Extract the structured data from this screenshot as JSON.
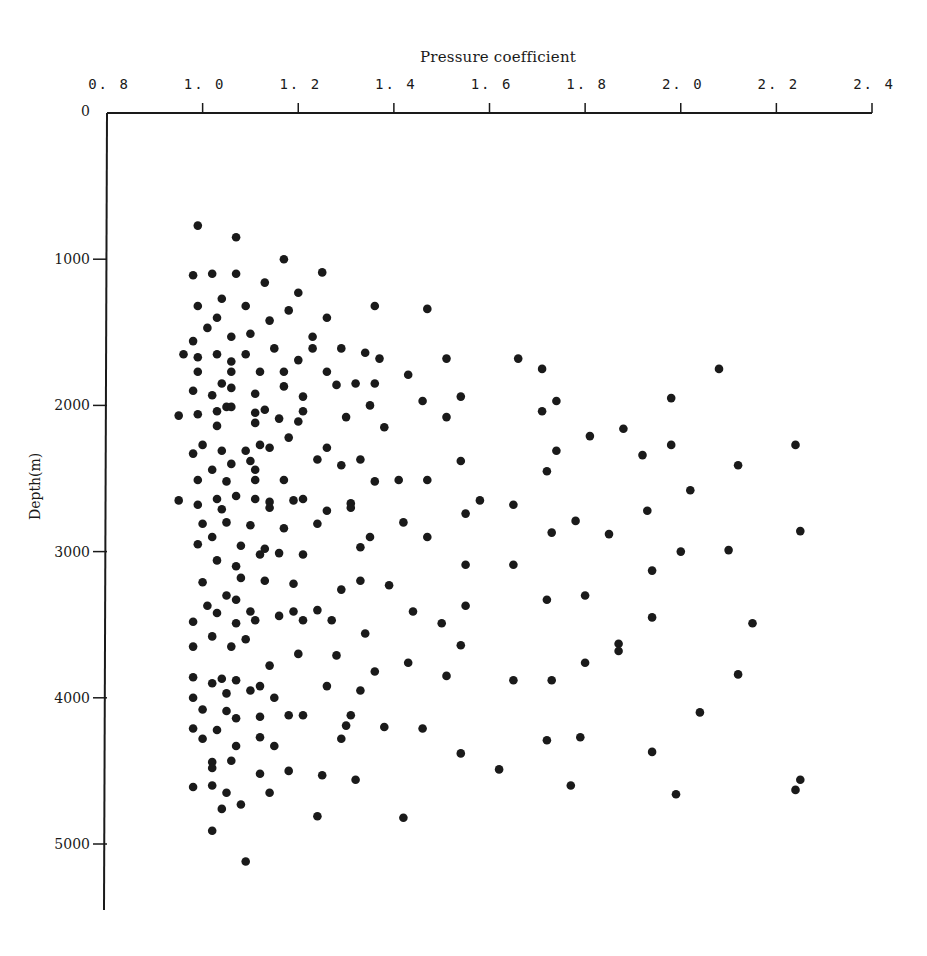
{
  "chart_data": {
    "type": "scatter",
    "title": "Pressure coefficient",
    "xlabel": "Pressure coefficient",
    "ylabel": "Depth(m)",
    "x_axis_position": "top",
    "y_axis_inverted": true,
    "xlim": [
      0.8,
      2.4
    ],
    "ylim": [
      0,
      5400
    ],
    "x_ticks": [
      "0.8",
      "1.0",
      "1.2",
      "1.4",
      "1.6",
      "1.8",
      "2.0",
      "2.2",
      "2.4"
    ],
    "y_ticks": [
      "0",
      "1000",
      "2000",
      "3000",
      "4000",
      "5000"
    ],
    "grid": false,
    "legend": null,
    "marker_color": "#1a1a1a",
    "points": [
      [
        0.99,
        770
      ],
      [
        1.07,
        850
      ],
      [
        1.17,
        1000
      ],
      [
        1.25,
        1090
      ],
      [
        0.98,
        1110
      ],
      [
        1.02,
        1100
      ],
      [
        1.07,
        1100
      ],
      [
        1.13,
        1160
      ],
      [
        1.2,
        1230
      ],
      [
        1.04,
        1270
      ],
      [
        1.09,
        1320
      ],
      [
        0.99,
        1320
      ],
      [
        1.18,
        1350
      ],
      [
        1.36,
        1320
      ],
      [
        1.47,
        1340
      ],
      [
        1.03,
        1400
      ],
      [
        1.14,
        1420
      ],
      [
        1.26,
        1400
      ],
      [
        1.01,
        1470
      ],
      [
        1.06,
        1530
      ],
      [
        1.1,
        1510
      ],
      [
        1.23,
        1530
      ],
      [
        0.98,
        1560
      ],
      [
        0.96,
        1650
      ],
      [
        0.99,
        1670
      ],
      [
        1.03,
        1650
      ],
      [
        1.09,
        1650
      ],
      [
        1.23,
        1610
      ],
      [
        1.29,
        1610
      ],
      [
        1.15,
        1610
      ],
      [
        1.34,
        1640
      ],
      [
        1.37,
        1680
      ],
      [
        1.51,
        1680
      ],
      [
        1.66,
        1680
      ],
      [
        1.71,
        1750
      ],
      [
        2.08,
        1750
      ],
      [
        1.06,
        1700
      ],
      [
        1.2,
        1690
      ],
      [
        0.99,
        1770
      ],
      [
        1.06,
        1770
      ],
      [
        1.12,
        1770
      ],
      [
        1.17,
        1770
      ],
      [
        1.26,
        1770
      ],
      [
        1.43,
        1790
      ],
      [
        1.36,
        1850
      ],
      [
        1.04,
        1850
      ],
      [
        1.06,
        1880
      ],
      [
        0.98,
        1900
      ],
      [
        1.02,
        1930
      ],
      [
        1.11,
        1920
      ],
      [
        1.17,
        1870
      ],
      [
        1.28,
        1860
      ],
      [
        1.21,
        1940
      ],
      [
        1.32,
        1850
      ],
      [
        1.46,
        1970
      ],
      [
        1.54,
        1940
      ],
      [
        1.74,
        1970
      ],
      [
        1.98,
        1950
      ],
      [
        1.05,
        2010
      ],
      [
        0.95,
        2070
      ],
      [
        0.99,
        2060
      ],
      [
        1.03,
        2040
      ],
      [
        1.06,
        2010
      ],
      [
        1.13,
        2030
      ],
      [
        1.11,
        2050
      ],
      [
        1.21,
        2040
      ],
      [
        1.3,
        2080
      ],
      [
        1.35,
        2000
      ],
      [
        1.11,
        2120
      ],
      [
        1.16,
        2090
      ],
      [
        1.03,
        2140
      ],
      [
        1.51,
        2080
      ],
      [
        1.71,
        2040
      ],
      [
        1.38,
        2150
      ],
      [
        1.81,
        2210
      ],
      [
        1.88,
        2160
      ],
      [
        1.0,
        2270
      ],
      [
        1.04,
        2310
      ],
      [
        1.09,
        2310
      ],
      [
        1.12,
        2270
      ],
      [
        1.14,
        2290
      ],
      [
        1.18,
        2220
      ],
      [
        1.2,
        2110
      ],
      [
        1.26,
        2290
      ],
      [
        1.74,
        2310
      ],
      [
        1.92,
        2340
      ],
      [
        1.98,
        2270
      ],
      [
        2.24,
        2270
      ],
      [
        0.98,
        2330
      ],
      [
        1.06,
        2400
      ],
      [
        1.1,
        2380
      ],
      [
        1.11,
        2440
      ],
      [
        1.24,
        2370
      ],
      [
        1.29,
        2410
      ],
      [
        1.33,
        2370
      ],
      [
        1.54,
        2380
      ],
      [
        1.72,
        2450
      ],
      [
        2.12,
        2410
      ],
      [
        1.02,
        2440
      ],
      [
        0.99,
        2510
      ],
      [
        1.05,
        2520
      ],
      [
        1.11,
        2510
      ],
      [
        1.17,
        2510
      ],
      [
        1.36,
        2520
      ],
      [
        1.41,
        2510
      ],
      [
        1.47,
        2510
      ],
      [
        2.02,
        2580
      ],
      [
        0.95,
        2650
      ],
      [
        0.99,
        2680
      ],
      [
        1.03,
        2640
      ],
      [
        1.07,
        2620
      ],
      [
        1.11,
        2640
      ],
      [
        1.14,
        2660
      ],
      [
        1.14,
        2700
      ],
      [
        1.19,
        2650
      ],
      [
        1.21,
        2640
      ],
      [
        1.31,
        2670
      ],
      [
        1.31,
        2700
      ],
      [
        1.04,
        2710
      ],
      [
        1.26,
        2720
      ],
      [
        1.58,
        2650
      ],
      [
        1.65,
        2680
      ],
      [
        1.55,
        2740
      ],
      [
        1.93,
        2720
      ],
      [
        1.0,
        2810
      ],
      [
        1.05,
        2800
      ],
      [
        1.1,
        2820
      ],
      [
        1.17,
        2840
      ],
      [
        1.24,
        2810
      ],
      [
        1.42,
        2800
      ],
      [
        1.78,
        2790
      ],
      [
        1.35,
        2900
      ],
      [
        1.47,
        2900
      ],
      [
        1.73,
        2870
      ],
      [
        1.85,
        2880
      ],
      [
        2.25,
        2860
      ],
      [
        0.99,
        2950
      ],
      [
        1.02,
        2900
      ],
      [
        1.08,
        2960
      ],
      [
        1.12,
        3020
      ],
      [
        1.16,
        3010
      ],
      [
        1.21,
        3020
      ],
      [
        1.33,
        2970
      ],
      [
        1.07,
        3100
      ],
      [
        1.03,
        3060
      ],
      [
        1.13,
        2980
      ],
      [
        1.55,
        3090
      ],
      [
        1.65,
        3090
      ],
      [
        2.0,
        3000
      ],
      [
        2.1,
        2990
      ],
      [
        1.94,
        3130
      ],
      [
        1.0,
        3210
      ],
      [
        1.08,
        3180
      ],
      [
        1.13,
        3200
      ],
      [
        1.19,
        3220
      ],
      [
        1.29,
        3260
      ],
      [
        1.33,
        3200
      ],
      [
        1.39,
        3230
      ],
      [
        1.8,
        3300
      ],
      [
        1.72,
        3330
      ],
      [
        1.05,
        3300
      ],
      [
        1.01,
        3370
      ],
      [
        1.07,
        3330
      ],
      [
        1.03,
        3420
      ],
      [
        1.1,
        3410
      ],
      [
        1.16,
        3440
      ],
      [
        1.19,
        3410
      ],
      [
        1.24,
        3400
      ],
      [
        1.44,
        3410
      ],
      [
        1.55,
        3370
      ],
      [
        1.94,
        3450
      ],
      [
        0.98,
        3480
      ],
      [
        1.07,
        3490
      ],
      [
        1.11,
        3470
      ],
      [
        1.21,
        3470
      ],
      [
        1.27,
        3470
      ],
      [
        1.5,
        3490
      ],
      [
        2.15,
        3490
      ],
      [
        1.02,
        3580
      ],
      [
        1.06,
        3650
      ],
      [
        1.09,
        3600
      ],
      [
        1.34,
        3560
      ],
      [
        1.54,
        3640
      ],
      [
        0.98,
        3650
      ],
      [
        1.87,
        3630
      ],
      [
        1.87,
        3680
      ],
      [
        1.2,
        3700
      ],
      [
        1.28,
        3710
      ],
      [
        1.43,
        3760
      ],
      [
        1.8,
        3760
      ],
      [
        1.14,
        3780
      ],
      [
        1.36,
        3820
      ],
      [
        2.12,
        3840
      ],
      [
        0.98,
        3860
      ],
      [
        1.04,
        3870
      ],
      [
        1.07,
        3880
      ],
      [
        1.12,
        3920
      ],
      [
        1.26,
        3920
      ],
      [
        1.51,
        3850
      ],
      [
        1.65,
        3880
      ],
      [
        1.73,
        3880
      ],
      [
        1.02,
        3900
      ],
      [
        0.98,
        4000
      ],
      [
        1.05,
        3970
      ],
      [
        1.1,
        3950
      ],
      [
        1.15,
        4000
      ],
      [
        1.33,
        3950
      ],
      [
        1.0,
        4080
      ],
      [
        1.05,
        4090
      ],
      [
        1.07,
        4140
      ],
      [
        1.12,
        4130
      ],
      [
        1.18,
        4120
      ],
      [
        1.21,
        4120
      ],
      [
        1.31,
        4120
      ],
      [
        1.3,
        4190
      ],
      [
        1.38,
        4200
      ],
      [
        1.46,
        4210
      ],
      [
        2.04,
        4100
      ],
      [
        0.98,
        4210
      ],
      [
        1.03,
        4220
      ],
      [
        1.0,
        4280
      ],
      [
        1.12,
        4270
      ],
      [
        1.07,
        4330
      ],
      [
        1.15,
        4330
      ],
      [
        1.29,
        4280
      ],
      [
        1.72,
        4290
      ],
      [
        1.79,
        4270
      ],
      [
        1.54,
        4380
      ],
      [
        1.94,
        4370
      ],
      [
        1.02,
        4440
      ],
      [
        1.02,
        4480
      ],
      [
        1.06,
        4430
      ],
      [
        1.12,
        4520
      ],
      [
        1.18,
        4500
      ],
      [
        1.25,
        4530
      ],
      [
        1.32,
        4560
      ],
      [
        1.62,
        4490
      ],
      [
        2.25,
        4560
      ],
      [
        0.98,
        4610
      ],
      [
        1.02,
        4600
      ],
      [
        1.05,
        4650
      ],
      [
        1.14,
        4650
      ],
      [
        1.77,
        4600
      ],
      [
        1.99,
        4660
      ],
      [
        2.24,
        4630
      ],
      [
        1.04,
        4760
      ],
      [
        1.08,
        4730
      ],
      [
        1.24,
        4810
      ],
      [
        1.42,
        4820
      ],
      [
        1.02,
        4910
      ],
      [
        1.09,
        5120
      ]
    ]
  },
  "axes": {
    "title": "Pressure coefficient",
    "ylabel": "Depth(m)",
    "x_ticks": [
      "0.8",
      "1.0",
      "1.2",
      "1.4",
      "1.6",
      "1.8",
      "2.0",
      "2.2",
      "2.4"
    ],
    "y_ticks": [
      "0",
      "1000",
      "2000",
      "3000",
      "4000",
      "5000"
    ]
  }
}
